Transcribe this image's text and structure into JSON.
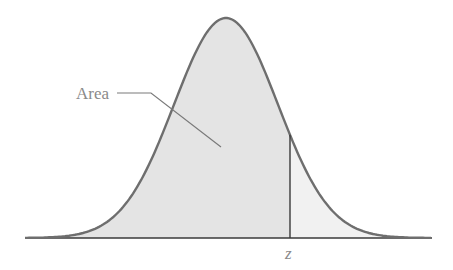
{
  "diagram": {
    "type": "normal-distribution-curve",
    "area_label": "Area",
    "z_label": "z",
    "colors": {
      "curve": "#6e6e6e",
      "baseline": "#3a3a3a",
      "z_line": "#3a3a3a",
      "area_fill": "#e4e4e4",
      "tail_fill": "#f1f1f1",
      "leader": "#7a7a7a",
      "text": "#8a8a8a"
    }
  }
}
